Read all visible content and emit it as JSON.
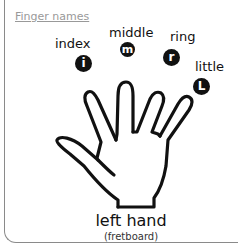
{
  "title": "Finger names",
  "fingers": [
    {
      "name": "index",
      "badge": "i"
    },
    {
      "name": "middle",
      "badge": "m"
    },
    {
      "name": "ring",
      "badge": "r"
    },
    {
      "name": "little",
      "badge": "L"
    }
  ],
  "hand": {
    "label": "left hand",
    "sublabel": "(fretboard)"
  },
  "colors": {
    "ink": "#111111",
    "title": "#999999",
    "border": "#8a8a8a"
  }
}
